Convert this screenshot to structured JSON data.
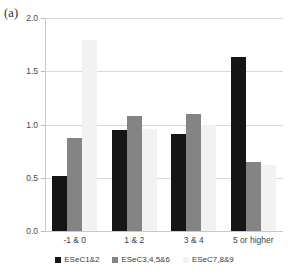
{
  "panel": {
    "label": "(a)"
  },
  "chart_data": {
    "type": "bar",
    "title": "",
    "xlabel": "",
    "ylabel": "",
    "categories": [
      "-1 & 0",
      "1 & 2",
      "3 & 4",
      "5 or higher"
    ],
    "series": [
      {
        "name": "ESeC1&2",
        "color": "#151515",
        "values": [
          0.52,
          0.95,
          0.91,
          1.63
        ]
      },
      {
        "name": "ESeC3,4,5&6",
        "color": "#848484",
        "values": [
          0.87,
          1.08,
          1.1,
          0.65
        ]
      },
      {
        "name": "ESeC7,8&9",
        "color": "#f2f2f2",
        "values": [
          1.79,
          0.96,
          1.0,
          0.62
        ]
      }
    ],
    "ylim": [
      0.0,
      2.0
    ],
    "yticks": [
      0.0,
      0.5,
      1.0,
      1.5,
      2.0
    ],
    "ytick_labels": [
      "0.0",
      "0.5",
      "1.0",
      "1.5",
      "2.0"
    ],
    "grid": true,
    "legend_position": "bottom"
  }
}
